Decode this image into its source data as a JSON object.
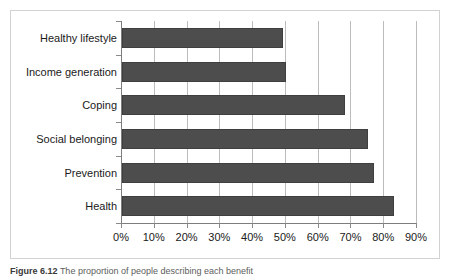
{
  "figure": {
    "caption_prefix": "Figure 6.12",
    "caption_text": "The proportion of people describing each benefit",
    "caption_full": "Figure 6.12 The proportion of people describing each benefit"
  },
  "chart_data": {
    "type": "bar",
    "orientation": "horizontal",
    "title": "",
    "xlabel": "",
    "ylabel": "",
    "xlim": [
      0,
      90
    ],
    "xtick_step": 10,
    "grid": true,
    "legend": "none",
    "value_suffix": "%",
    "bar_color": "#4d4d4d",
    "grid_color": "#bcbcbc",
    "axis_color": "#7d7d7d",
    "categories": [
      "Healthy lifestyle",
      "Income generation",
      "Coping",
      "Social belonging",
      "Prevention",
      "Health"
    ],
    "values": [
      49,
      50,
      68,
      75,
      77,
      83
    ],
    "xticklabels": [
      "0%",
      "10%",
      "20%",
      "30%",
      "40%",
      "50%",
      "60%",
      "70%",
      "80%",
      "90%"
    ],
    "xtickvalues": [
      0,
      10,
      20,
      30,
      40,
      50,
      60,
      70,
      80,
      90
    ]
  }
}
